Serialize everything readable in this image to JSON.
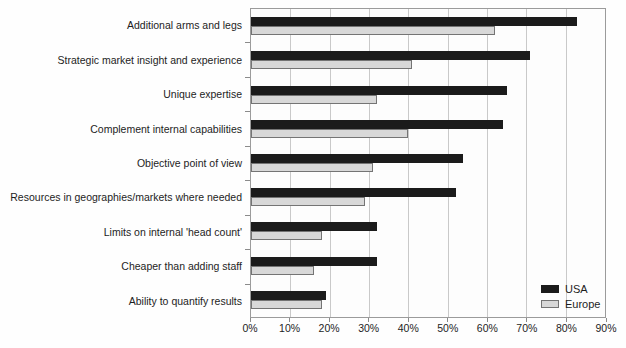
{
  "chart_data": {
    "type": "bar",
    "orientation": "horizontal",
    "title": "",
    "xlabel": "",
    "ylabel": "",
    "categories": [
      "Additional arms and legs",
      "Strategic market insight and experience",
      "Unique expertise",
      "Complement internal capabilities",
      "Objective point of view",
      "Resources in geographies/markets where needed",
      "Limits on internal 'head count'",
      "Cheaper than adding staff",
      "Ability to quantify results"
    ],
    "series": [
      {
        "name": "USA",
        "color": "#1b1b1b",
        "border_color": "#1b1b1b",
        "values": [
          83,
          71,
          65,
          64,
          54,
          52,
          32,
          32,
          19
        ]
      },
      {
        "name": "Europe",
        "color": "#d8d8d8",
        "border_color": "#747474",
        "values": [
          62,
          41,
          32,
          40,
          31,
          29,
          18,
          16,
          18
        ]
      }
    ],
    "xlim": [
      0,
      90
    ],
    "x_tick_values": [
      0,
      10,
      20,
      30,
      40,
      50,
      60,
      70,
      80,
      90
    ],
    "x_tick_labels": [
      "0%",
      "10%",
      "20%",
      "30%",
      "40%",
      "50%",
      "60%",
      "70%",
      "80%",
      "90%"
    ],
    "grid": true,
    "legend_position": "bottom-right"
  },
  "palette": {
    "plot_border": "#9b9b9b",
    "gridline": "#c9c9c9",
    "tick": "#8b8b8b",
    "text": "#1d1d1d",
    "background": "#fefefe"
  }
}
